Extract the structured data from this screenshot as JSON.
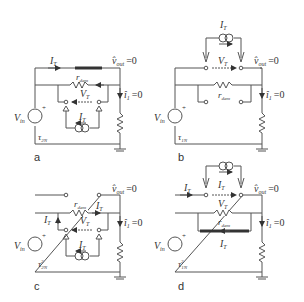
{
  "figure": {
    "panels": [
      {
        "id": "a",
        "label": "a",
        "current_top": "I_T",
        "vout": "v̂",
        "vout_sub": "out",
        "vout_eq": "=0",
        "r": "r",
        "r_sub": "dam",
        "vt": "V",
        "vt_sub": "T",
        "i1": "î",
        "i1_sub": "1",
        "i1_eq": "=0",
        "src": "I",
        "src_sub": "T",
        "vin": "V",
        "vin_sub": "in",
        "tau": "τ",
        "tau_sub": "2N",
        "tau_sup": ""
      },
      {
        "id": "b",
        "label": "b",
        "src": "I",
        "src_sub": "T",
        "vt": "V",
        "vt_sub": "T",
        "vout": "v̂",
        "vout_sub": "out",
        "vout_eq": "=0",
        "r": "r",
        "r_sub": "dam",
        "i1": "î",
        "i1_sub": "1",
        "i1_eq": "=0",
        "vin": "V",
        "vin_sub": "in",
        "tau": "τ",
        "tau_sub": "1N",
        "tau_sup": ""
      },
      {
        "id": "c",
        "label": "c",
        "vout": "v̂",
        "vout_sub": "out",
        "vout_eq": "=0",
        "r": "r",
        "r_sub": "dam",
        "it_right": "I",
        "it_right_sub": "T",
        "it_left": "I",
        "it_left_sub": "T",
        "vt": "V",
        "vt_sub": "T",
        "i1": "î",
        "i1_sub": "1",
        "i1_eq": "=0",
        "src": "I",
        "src_sub": "T",
        "vin": "V",
        "vin_sub": "in",
        "tau": "τ",
        "tau_sub": "2N",
        "tau_sup": "2"
      },
      {
        "id": "d",
        "label": "d",
        "it_top": "I",
        "it_top_sub": "T",
        "it_src": "I",
        "it_src_sub": "T",
        "vout": "v̂",
        "vout_sub": "out",
        "vout_eq": "=0",
        "vt": "V",
        "vt_sub": "T",
        "r": "r",
        "r_sub": "dam",
        "i1": "î",
        "i1_sub": "1",
        "i1_eq": "=0",
        "it_bottom": "I",
        "it_bottom_sub": "T",
        "vin": "V",
        "vin_sub": "in",
        "tau": "τ",
        "tau_sub": "1N",
        "tau_sup": "2"
      }
    ]
  }
}
